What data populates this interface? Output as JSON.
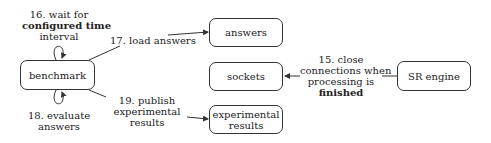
{
  "nodes": {
    "benchmark": "benchmark",
    "answers": "answers",
    "sockets": "sockets",
    "experimental_results_line1": "experimental",
    "experimental_results_line2": "results",
    "sr_engine": "SR engine"
  },
  "edges": {
    "e16": {
      "line1": "16. wait for",
      "line2": "configured time",
      "line3": "interval"
    },
    "e17": {
      "line1": "17. load answers"
    },
    "e18": {
      "line1": "18. evaluate",
      "line2": "answers"
    },
    "e19": {
      "line1": "19. publish",
      "line2": "experimental",
      "line3": "results"
    },
    "e15": {
      "line1": "15. close",
      "line2": "connections when",
      "line3": "processing is",
      "line4": "finished"
    }
  }
}
